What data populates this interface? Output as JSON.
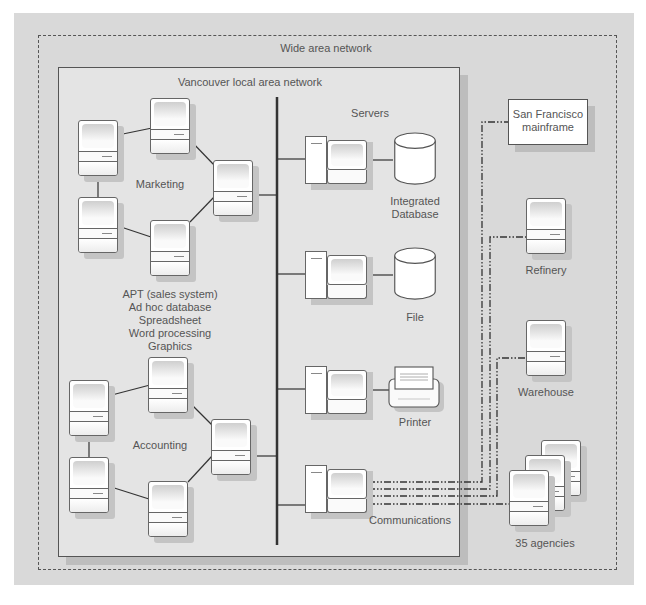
{
  "diagram": {
    "wan_label": "Wide area network",
    "lan_label": "Vancouver local area network",
    "servers_label": "Servers",
    "groups": {
      "marketing": "Marketing",
      "accounting": "Accounting"
    },
    "applications": {
      "line1": "APT (sales system)",
      "line2": "Ad hoc database",
      "line3": "Spreadsheet",
      "line4": "Word processing",
      "line5": "Graphics"
    },
    "server_nodes": {
      "integrated_db_line1": "Integrated",
      "integrated_db_line2": "Database",
      "file": "File",
      "printer": "Printer",
      "communications": "Communications"
    },
    "remote_sites": {
      "mainframe_line1": "San Francisco",
      "mainframe_line2": "mainframe",
      "refinery": "Refinery",
      "warehouse": "Warehouse",
      "agencies": "35 agencies"
    },
    "colors": {
      "panel_bg": "#d9d9d9",
      "lan_bg": "#e4e4e4",
      "line": "#444444",
      "text": "#555555"
    }
  }
}
